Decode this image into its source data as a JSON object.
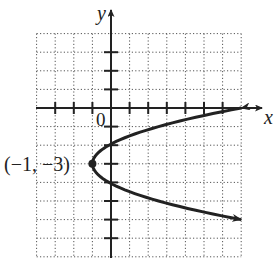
{
  "chart_data": {
    "type": "line",
    "title": "",
    "xlabel": "x",
    "ylabel": "y",
    "origin_label": "0",
    "xlim": [
      -4,
      7
    ],
    "ylim": [
      -8,
      4
    ],
    "grid": true,
    "grid_style": "dotted",
    "x_ticks": [
      -3,
      -2,
      -1,
      1,
      2,
      3,
      4,
      5,
      6
    ],
    "y_ticks": [
      3,
      2,
      1,
      -1,
      -2,
      -3,
      -4,
      -5,
      -6,
      -7
    ],
    "series": [
      {
        "name": "parabola",
        "equation": "x = (8/9)(y + 3)^2 - 1",
        "vertex": [
          -1,
          -3
        ],
        "points": [
          [
            7,
            0
          ],
          [
            3.5,
            -0.75
          ],
          [
            0,
            -1.94
          ],
          [
            -1,
            -3
          ],
          [
            0,
            -4.06
          ],
          [
            3.5,
            -5.25
          ],
          [
            7,
            -6
          ]
        ],
        "arrows": "both ends"
      }
    ],
    "annotations": [
      {
        "text": "(−1, −3)",
        "point": [
          -1,
          -3
        ],
        "marker": "filled-circle"
      }
    ]
  }
}
